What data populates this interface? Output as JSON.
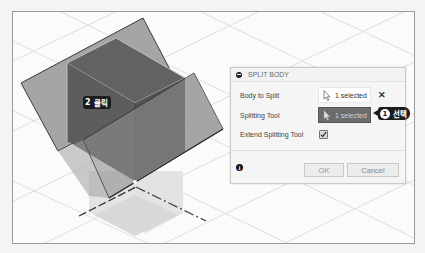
{
  "viewport": {
    "colors": {
      "background": "#fbfbfb",
      "grid_line": "#dcdcdc",
      "cube_face_top": "#5f5f5f",
      "cube_face_left": "#5a5a5a",
      "cube_face_right": "#505050",
      "plane": "#9a9a9a",
      "plane_edge": "#3c3c3c",
      "shadow": "#d6d6d6"
    },
    "annotations": [
      {
        "number": "2",
        "text": "클릭"
      }
    ]
  },
  "dialog": {
    "title": "SPLIT BODY",
    "rows": [
      {
        "label": "Body to Split",
        "value": "1 selected",
        "state": "normal",
        "clear_icon": "✕"
      },
      {
        "label": "Splitting Tool",
        "value": "1 selected",
        "state": "active"
      },
      {
        "label": "Extend Splitting Tool",
        "checked": true
      }
    ],
    "footer": {
      "info_icon": "i",
      "ok_label": "OK",
      "cancel_label": "Cancel"
    },
    "annotation": {
      "number": "1",
      "text": "선택"
    }
  }
}
